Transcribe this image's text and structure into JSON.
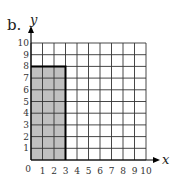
{
  "part_label": "b.",
  "chart_data": {
    "type": "area",
    "title": "",
    "xlabel": "x",
    "ylabel": "y",
    "xlim": [
      0,
      10
    ],
    "ylim": [
      0,
      10
    ],
    "grid": true,
    "x_ticks": [
      "0",
      "1",
      "2",
      "3",
      "4",
      "5",
      "6",
      "7",
      "8",
      "9",
      "10"
    ],
    "y_ticks": [
      "1",
      "2",
      "3",
      "4",
      "5",
      "6",
      "7",
      "8",
      "9",
      "10"
    ],
    "shaded_region": {
      "x_from": 0,
      "x_to": 3,
      "y_from": 0,
      "y_to": 8,
      "fill": "#c0c0c0"
    },
    "boundary": [
      [
        0,
        8
      ],
      [
        3,
        8
      ],
      [
        3,
        0
      ]
    ]
  },
  "colors": {
    "grid": "#333333",
    "shade": "#c0c0c0",
    "boundary": "#000000"
  }
}
